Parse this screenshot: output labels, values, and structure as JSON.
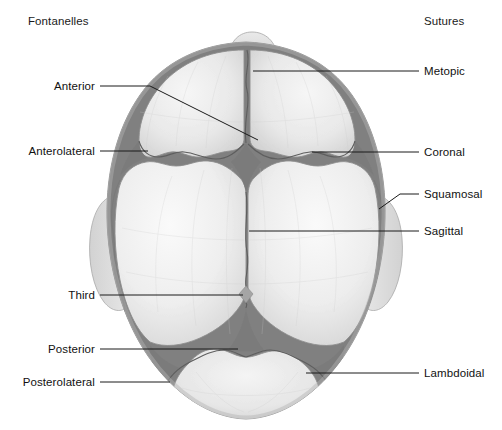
{
  "figure": {
    "width": 502,
    "height": 430,
    "background": "#ffffff"
  },
  "headings": {
    "left": "Fontanelles",
    "right": "Sutures"
  },
  "colors": {
    "bone_light": "#efefef",
    "bone_mid": "#e2e2e2",
    "bone_shadow": "#cfcfcf",
    "bone_flap": "#d8d8d8",
    "fontanelle_dark": "#808080",
    "fontanelle_third": "#a8a8a8",
    "suture_line": "#6b6b6b",
    "outline": "#9a9a9a",
    "leader_line": "#1a1a1a",
    "text": "#111111"
  },
  "labels": {
    "fontanelles": [
      {
        "id": "anterior",
        "text": "Anterior",
        "text_x": 95,
        "text_y": 86,
        "line": [
          [
            100,
            86
          ],
          [
            150,
            86
          ],
          [
            258,
            140
          ]
        ]
      },
      {
        "id": "anterolateral",
        "text": "Anterolateral",
        "text_x": 95,
        "text_y": 151,
        "line": [
          [
            100,
            151
          ],
          [
            148,
            151
          ]
        ]
      },
      {
        "id": "third",
        "text": "Third",
        "text_x": 95,
        "text_y": 295,
        "line": [
          [
            100,
            295
          ],
          [
            243,
            295
          ]
        ]
      },
      {
        "id": "posterior",
        "text": "Posterior",
        "text_x": 95,
        "text_y": 349,
        "line": [
          [
            100,
            349
          ],
          [
            238,
            349
          ]
        ]
      },
      {
        "id": "posterolateral",
        "text": "Posterolateral",
        "text_x": 95,
        "text_y": 382,
        "line": [
          [
            100,
            382
          ],
          [
            170,
            382
          ]
        ]
      }
    ],
    "sutures": [
      {
        "id": "metopic",
        "text": "Metopic",
        "text_x": 424,
        "text_y": 71,
        "line": [
          [
            419,
            71
          ],
          [
            253,
            71
          ]
        ]
      },
      {
        "id": "coronal",
        "text": "Coronal",
        "text_x": 424,
        "text_y": 152,
        "line": [
          [
            419,
            152
          ],
          [
            312,
            152
          ]
        ]
      },
      {
        "id": "squamosal",
        "text": "Squamosal",
        "text_x": 424,
        "text_y": 194,
        "line": [
          [
            419,
            194
          ],
          [
            400,
            194
          ],
          [
            379,
            209
          ]
        ]
      },
      {
        "id": "sagittal",
        "text": "Sagittal",
        "text_x": 424,
        "text_y": 231,
        "line": [
          [
            419,
            231
          ],
          [
            249,
            231
          ]
        ]
      },
      {
        "id": "lambdoidal",
        "text": "Lambdoidal",
        "text_x": 424,
        "text_y": 373,
        "line": [
          [
            419,
            373
          ],
          [
            306,
            373
          ]
        ]
      }
    ]
  },
  "anatomy": {
    "bones": [
      "left frontal bone",
      "right frontal bone",
      "left parietal bone",
      "right parietal bone",
      "occipital bone",
      "left temporal flap",
      "right temporal flap",
      "nasal prominence"
    ],
    "fontanelle_regions": [
      "anterior fontanelle",
      "left anterolateral (sphenoid) fontanelle",
      "right anterolateral (sphenoid) fontanelle",
      "third fontanelle",
      "posterior fontanelle",
      "left posterolateral (mastoid) fontanelle",
      "right posterolateral (mastoid) fontanelle"
    ],
    "suture_regions": [
      "metopic suture",
      "coronal suture",
      "squamosal suture",
      "sagittal suture",
      "lambdoidal suture"
    ]
  }
}
